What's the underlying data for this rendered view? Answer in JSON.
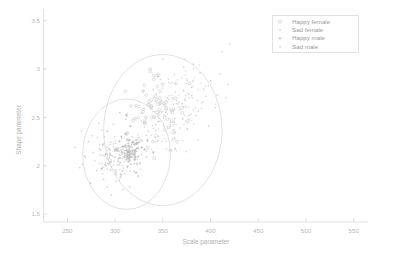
{
  "chart_data": {
    "type": "scatter",
    "title": "",
    "xlabel": "Scale parameter",
    "ylabel": "Shape parameter",
    "xlim": [
      225,
      565
    ],
    "ylim": [
      1.42,
      3.62
    ],
    "xticks": [
      250,
      300,
      350,
      400,
      450,
      500,
      550
    ],
    "yticks": [
      1.5,
      2,
      2.5,
      3,
      3.5
    ],
    "xtick_labels": [
      "250",
      "300",
      "350",
      "400",
      "450",
      "500",
      "550"
    ],
    "ytick_labels": [
      "1.5",
      "2",
      "2.5",
      "3",
      "3.5"
    ],
    "grid": false,
    "legend_position": "top-right",
    "legend": [
      {
        "label": "Happy female",
        "marker": "open-circle-marker",
        "color": "#c9c9c9"
      },
      {
        "label": "Sad female",
        "marker": "dot-marker",
        "color": "#cfcfcf"
      },
      {
        "label": "Happy male",
        "marker": "plus-marker",
        "color": "#b5b5b5"
      },
      {
        "label": "Sad male",
        "marker": "dot-marker",
        "color": "#d2d2d2"
      }
    ],
    "annotations": [
      {
        "name": "confidence-ellipse-female",
        "center_x": 312,
        "center_y": 2.12,
        "radius_x": 46,
        "radius_y": 0.57
      },
      {
        "name": "confidence-ellipse-male",
        "center_x": 350,
        "center_y": 2.37,
        "radius_x": 62,
        "radius_y": 0.78
      }
    ],
    "series": [
      {
        "name": "Happy female",
        "marker": "open-circle-marker",
        "color": "#c9c9c9",
        "points": [
          [
            338,
            2.62
          ],
          [
            352,
            2.5
          ],
          [
            331,
            2.44
          ],
          [
            343,
            2.31
          ],
          [
            360,
            2.55
          ],
          [
            325,
            2.28
          ],
          [
            347,
            2.7
          ],
          [
            356,
            2.4
          ],
          [
            334,
            2.19
          ],
          [
            362,
            2.34
          ],
          [
            319,
            2.47
          ],
          [
            370,
            2.6
          ],
          [
            341,
            2.08
          ],
          [
            329,
            2.56
          ],
          [
            365,
            2.25
          ],
          [
            350,
            2.84
          ],
          [
            312,
            2.33
          ],
          [
            376,
            2.46
          ],
          [
            344,
            2.93
          ],
          [
            358,
            2.16
          ]
        ]
      },
      {
        "name": "Sad female",
        "marker": "dot-marker",
        "color": "#cfcfcf",
        "points": [
          [
            268,
            2.1
          ],
          [
            281,
            1.95
          ],
          [
            295,
            2.22
          ],
          [
            303,
            2.05
          ],
          [
            288,
            1.86
          ],
          [
            276,
            2.31
          ],
          [
            310,
            1.92
          ],
          [
            298,
            2.43
          ],
          [
            285,
            2.16
          ],
          [
            320,
            2.02
          ],
          [
            263,
            1.98
          ],
          [
            292,
            1.78
          ],
          [
            307,
            2.28
          ],
          [
            272,
            2.25
          ],
          [
            315,
            2.14
          ],
          [
            258,
            2.19
          ],
          [
            301,
            1.84
          ],
          [
            286,
            2.37
          ],
          [
            324,
            1.89
          ],
          [
            279,
            2.05
          ],
          [
            311,
            2.48
          ],
          [
            296,
            1.7
          ],
          [
            265,
            2.36
          ],
          [
            333,
            2.09
          ],
          [
            290,
            2.01
          ],
          [
            305,
            2.55
          ],
          [
            274,
            1.82
          ],
          [
            318,
            2.3
          ],
          [
            283,
            2.44
          ],
          [
            300,
            1.96
          ]
        ]
      },
      {
        "name": "Happy male",
        "marker": "plus-marker",
        "color": "#b5b5b5",
        "points": [
          [
            310,
            2.13
          ],
          [
            315,
            2.06
          ],
          [
            308,
            2.2
          ],
          [
            320,
            2.11
          ],
          [
            313,
            1.99
          ],
          [
            305,
            2.08
          ],
          [
            318,
            2.24
          ],
          [
            311,
            2.33
          ],
          [
            323,
            2.02
          ],
          [
            300,
            2.17
          ],
          [
            328,
            2.19
          ],
          [
            295,
            2.04
          ],
          [
            316,
            2.41
          ],
          [
            306,
            1.91
          ],
          [
            334,
            2.26
          ],
          [
            290,
            2.12
          ],
          [
            322,
            1.93
          ],
          [
            312,
            2.52
          ],
          [
            340,
            2.14
          ],
          [
            286,
            1.97
          ]
        ]
      },
      {
        "name": "Sad male",
        "marker": "dot-marker",
        "color": "#d2d2d2",
        "points": [
          [
            355,
            2.7
          ],
          [
            368,
            2.58
          ],
          [
            380,
            2.81
          ],
          [
            345,
            2.92
          ],
          [
            392,
            2.66
          ],
          [
            372,
            3.02
          ],
          [
            358,
            2.45
          ],
          [
            400,
            2.88
          ],
          [
            385,
            2.52
          ],
          [
            363,
            2.76
          ],
          [
            410,
            2.95
          ],
          [
            376,
            2.38
          ],
          [
            350,
            3.1
          ],
          [
            395,
            2.72
          ],
          [
            366,
            2.64
          ],
          [
            405,
            2.6
          ],
          [
            382,
            3.05
          ],
          [
            340,
            2.79
          ],
          [
            418,
            2.84
          ],
          [
            371,
            2.49
          ],
          [
            389,
            2.96
          ],
          [
            360,
            2.86
          ],
          [
            398,
            2.41
          ],
          [
            412,
            3.18
          ],
          [
            353,
            2.55
          ],
          [
            375,
            2.9
          ],
          [
            407,
            2.73
          ],
          [
            347,
            2.66
          ],
          [
            420,
            3.26
          ],
          [
            384,
            2.6
          ]
        ]
      }
    ]
  },
  "axes": {
    "x_title": "Scale parameter",
    "y_title": "Shape parameter"
  }
}
